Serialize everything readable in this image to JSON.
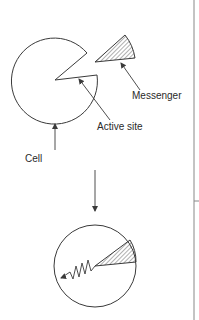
{
  "diagram": {
    "labels": {
      "messenger": "Messenger",
      "active_site": "Active site",
      "cell": "Cell"
    },
    "colors": {
      "stroke": "#3a3a3a",
      "text": "#2a2a2a",
      "background": "#ffffff",
      "divider": "#888888"
    },
    "stages": [
      {
        "name": "before-binding",
        "elements": [
          "cell",
          "active-site",
          "messenger"
        ]
      },
      {
        "name": "after-binding",
        "elements": [
          "cell-with-bound-messenger",
          "signal-squiggle-arrow"
        ]
      }
    ]
  }
}
